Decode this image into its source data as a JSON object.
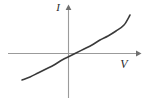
{
  "figure": {
    "background_color": "#ffffff",
    "axis_color": "#9b9b9b",
    "curve_color": "#3a3a3a",
    "label_color": "#2b2b2b"
  },
  "labels": {
    "y_axis": "I",
    "x_axis": "V"
  },
  "icons": {
    "y_axis_arrow": "arrow-up-icon",
    "x_axis_arrow": "arrow-right-icon"
  },
  "chart_data": {
    "type": "line",
    "title": "",
    "xlabel": "V",
    "ylabel": "I",
    "xlim": [
      -2.3,
      2.7
    ],
    "ylim": [
      -1.6,
      1.95
    ],
    "grid": false,
    "legend": null,
    "origin_px": [
      68,
      53
    ],
    "axes": {
      "x_axis": {
        "y_px": 53,
        "x_start_px": 8,
        "x_end_px": 140,
        "arrow_at": "end"
      },
      "y_axis": {
        "x_px": 68,
        "y_start_px": 98,
        "y_end_px": 6,
        "arrow_at": "top"
      }
    },
    "series": [
      {
        "name": "I(V)",
        "description": "Monotonic increasing slightly S-shaped (ohmic-like) curve through the origin",
        "color": "#3a3a3a",
        "x": [
          -2.3,
          -2.0,
          -1.7,
          -1.4,
          -1.1,
          -0.8,
          -0.5,
          -0.25,
          0.0,
          0.25,
          0.5,
          0.8,
          1.1,
          1.4,
          1.7,
          2.0,
          2.3,
          2.58
        ],
        "y": [
          -1.55,
          -1.38,
          -1.18,
          -0.99,
          -0.79,
          -0.58,
          -0.37,
          -0.19,
          0.0,
          0.19,
          0.38,
          0.6,
          0.81,
          1.01,
          1.2,
          1.38,
          1.55,
          1.7
        ],
        "points_px": [
          [
            22,
            80
          ],
          [
            30,
            77
          ],
          [
            38,
            73
          ],
          [
            46,
            69
          ],
          [
            54,
            65
          ],
          [
            62,
            60
          ],
          [
            70,
            56
          ],
          [
            76,
            53
          ],
          [
            84,
            49
          ],
          [
            92,
            45
          ],
          [
            100,
            40
          ],
          [
            108,
            36
          ],
          [
            116,
            31
          ],
          [
            124,
            25
          ],
          [
            130,
            15
          ]
        ]
      }
    ]
  }
}
